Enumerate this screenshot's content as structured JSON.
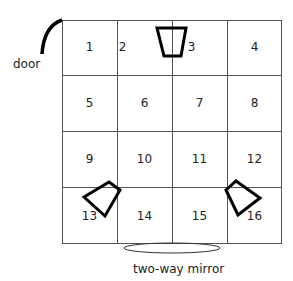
{
  "labels": {
    "door": "door",
    "mirror": "two-way mirror"
  },
  "cells": [
    "1",
    "2",
    "3",
    "4",
    "5",
    "6",
    "7",
    "8",
    "9",
    "10",
    "11",
    "12",
    "13",
    "14",
    "15",
    "16"
  ],
  "colors": {
    "line": "#555555",
    "shape": "#000000"
  }
}
